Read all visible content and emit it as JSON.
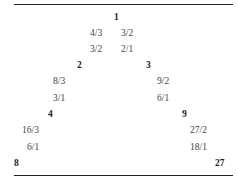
{
  "diagram": {
    "type": "triangle-lattice",
    "nodes": {
      "apex": "1",
      "left": [
        "2",
        "4",
        "8"
      ],
      "right": [
        "3",
        "9",
        "27"
      ]
    },
    "apex_ratios": {
      "row1": [
        "4/3",
        "3/2"
      ],
      "row2": [
        "3/2",
        "2/1"
      ]
    },
    "left_ratios": [
      {
        "upper": "8/3",
        "lower": "3/1"
      },
      {
        "upper": "16/3",
        "lower": "6/1"
      }
    ],
    "right_ratios": [
      {
        "upper": "9/2",
        "lower": "6/1"
      },
      {
        "upper": "27/2",
        "lower": "18/1"
      }
    ]
  }
}
